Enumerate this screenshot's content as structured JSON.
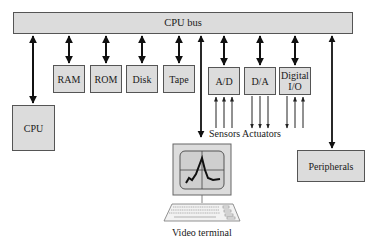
{
  "diagram": {
    "bus": {
      "label": "CPU bus"
    },
    "memory_devices": [
      {
        "label": "RAM"
      },
      {
        "label": "ROM"
      },
      {
        "label": "Disk"
      },
      {
        "label": "Tape"
      }
    ],
    "io_devices": [
      {
        "label": "A/D"
      },
      {
        "label": "D/A"
      },
      {
        "label": "Digital I/O"
      }
    ],
    "cpu": {
      "label": "CPU"
    },
    "peripherals": {
      "label": "Peripherals"
    },
    "sensors_actuators_label": "Sensors Actuators",
    "terminal": {
      "label": "Video terminal",
      "icon": "video-terminal-icon"
    },
    "connections": [
      {
        "from": "CPU bus",
        "to": "CPU",
        "type": "bidirectional"
      },
      {
        "from": "CPU bus",
        "to": "RAM",
        "type": "bidirectional"
      },
      {
        "from": "CPU bus",
        "to": "ROM",
        "type": "bidirectional"
      },
      {
        "from": "CPU bus",
        "to": "Disk",
        "type": "bidirectional"
      },
      {
        "from": "CPU bus",
        "to": "Tape",
        "type": "bidirectional"
      },
      {
        "from": "CPU bus",
        "to": "Video terminal",
        "type": "bidirectional"
      },
      {
        "from": "CPU bus",
        "to": "A/D",
        "type": "bidirectional"
      },
      {
        "from": "CPU bus",
        "to": "D/A",
        "type": "bidirectional"
      },
      {
        "from": "CPU bus",
        "to": "Digital I/O",
        "type": "bidirectional"
      },
      {
        "from": "CPU bus",
        "to": "Peripherals",
        "type": "bidirectional"
      },
      {
        "from": "Sensors",
        "to": "A/D",
        "count": 3,
        "type": "input"
      },
      {
        "from": "D/A",
        "to": "Actuators",
        "count": 3,
        "type": "output"
      },
      {
        "from": "Digital I/O",
        "to": "external",
        "count": 1,
        "type": "output"
      },
      {
        "from": "external",
        "to": "Digital I/O",
        "count": 2,
        "type": "input"
      }
    ],
    "colors": {
      "box_fill": "#dcdcdc",
      "box_border": "#555555",
      "line": "#111111"
    }
  }
}
